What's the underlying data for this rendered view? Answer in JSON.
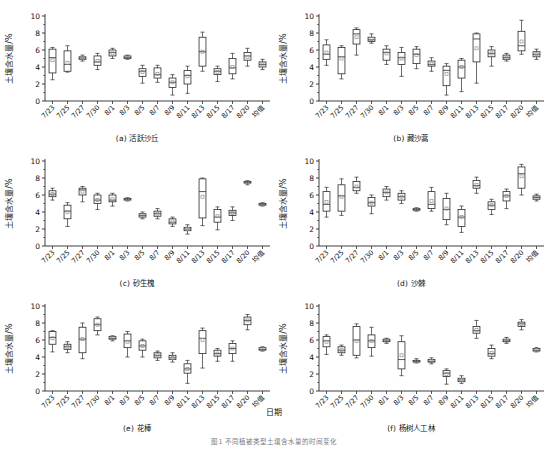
{
  "figure": {
    "xaxis_title": "日期",
    "caption": "图1  不同植被类型土壤含水量的时间变化",
    "ylabel": "土壤含水量/%",
    "yticks": [
      0,
      2,
      4,
      6,
      8,
      10
    ],
    "ylim": [
      0,
      10
    ],
    "categories": [
      "7/23",
      "7/25",
      "7/27",
      "7/30",
      "8/1",
      "8/3",
      "8/5",
      "8/7",
      "8/9",
      "8/11",
      "8/13",
      "8/15",
      "8/17",
      "8/20",
      "均值"
    ],
    "colors": {
      "line": "#2b2b2b",
      "box_fill": "#ffffff",
      "mean_marker": "#909090",
      "background": "#ffffff"
    }
  },
  "chart_data": [
    {
      "type": "box",
      "panel": "a",
      "title": "(a) 活跃沙丘",
      "xlabel": "日期",
      "ylabel": "土壤含水量/%",
      "ylim": [
        0,
        10
      ],
      "yticks": [
        0,
        2,
        4,
        6,
        8,
        10
      ],
      "grid": false,
      "categories": [
        "7/23",
        "7/25",
        "7/27",
        "7/30",
        "8/1",
        "8/3",
        "8/5",
        "8/7",
        "8/9",
        "8/11",
        "8/13",
        "8/15",
        "8/17",
        "8/20",
        "均值"
      ],
      "boxes": [
        {
          "x": "7/23",
          "min": 2.5,
          "q1": 3.3,
          "median": 5.1,
          "q3": 6.1,
          "max": 6.3,
          "mean": 4.8
        },
        {
          "x": "7/25",
          "min": 3.4,
          "q1": 3.5,
          "median": 4.3,
          "q3": 5.9,
          "max": 6.5,
          "mean": 4.5
        },
        {
          "x": "7/27",
          "min": 4.7,
          "q1": 4.9,
          "median": 5.05,
          "q3": 5.2,
          "max": 5.4,
          "mean": 5.05
        },
        {
          "x": "7/30",
          "min": 3.7,
          "q1": 4.2,
          "median": 4.6,
          "q3": 5.3,
          "max": 5.6,
          "mean": 4.7
        },
        {
          "x": "8/1",
          "min": 5.0,
          "q1": 5.3,
          "median": 5.7,
          "q3": 6.0,
          "max": 6.2,
          "mean": 5.6
        },
        {
          "x": "8/3",
          "min": 4.9,
          "q1": 5.0,
          "median": 5.1,
          "q3": 5.3,
          "max": 5.4,
          "mean": 5.1
        },
        {
          "x": "8/5",
          "min": 2.1,
          "q1": 2.9,
          "median": 3.5,
          "q3": 3.8,
          "max": 4.2,
          "mean": 3.4
        },
        {
          "x": "8/7",
          "min": 2.2,
          "q1": 2.7,
          "median": 3.1,
          "q3": 3.9,
          "max": 4.2,
          "mean": 3.2
        },
        {
          "x": "8/9",
          "min": 0.7,
          "q1": 1.6,
          "median": 2.2,
          "q3": 2.7,
          "max": 3.1,
          "mean": 2.2
        },
        {
          "x": "8/11",
          "min": 0.9,
          "q1": 2.0,
          "median": 3.0,
          "q3": 3.6,
          "max": 4.1,
          "mean": 2.9
        },
        {
          "x": "8/13",
          "min": 3.5,
          "q1": 4.1,
          "median": 5.8,
          "q3": 7.5,
          "max": 8.1,
          "mean": 5.8
        },
        {
          "x": "8/15",
          "min": 2.3,
          "q1": 3.1,
          "median": 3.5,
          "q3": 3.8,
          "max": 4.1,
          "mean": 3.4
        },
        {
          "x": "8/17",
          "min": 2.6,
          "q1": 3.2,
          "median": 3.9,
          "q3": 5.0,
          "max": 5.6,
          "mean": 4.0
        },
        {
          "x": "8/20",
          "min": 4.1,
          "q1": 4.8,
          "median": 5.3,
          "q3": 5.7,
          "max": 6.2,
          "mean": 5.2
        },
        {
          "x": "均值",
          "min": 3.7,
          "q1": 4.0,
          "median": 4.3,
          "q3": 4.6,
          "max": 4.9,
          "mean": 4.3
        }
      ]
    },
    {
      "type": "box",
      "panel": "b",
      "title": "(b) 藏沙蒿",
      "xlabel": "日期",
      "ylabel": "土壤含水量/%",
      "ylim": [
        0,
        10
      ],
      "yticks": [
        0,
        2,
        4,
        6,
        8,
        10
      ],
      "grid": false,
      "categories": [
        "7/23",
        "7/25",
        "7/27",
        "7/30",
        "8/1",
        "8/3",
        "8/5",
        "8/7",
        "8/9",
        "8/11",
        "8/13",
        "8/15",
        "8/17",
        "8/20",
        "均值"
      ],
      "boxes": [
        {
          "x": "7/23",
          "min": 4.2,
          "q1": 4.9,
          "median": 5.5,
          "q3": 6.6,
          "max": 7.2,
          "mean": 5.7
        },
        {
          "x": "7/25",
          "min": 2.6,
          "q1": 3.2,
          "median": 5.2,
          "q3": 6.3,
          "max": 6.5,
          "mean": 5.0
        },
        {
          "x": "7/27",
          "min": 5.4,
          "q1": 6.7,
          "median": 7.9,
          "q3": 8.4,
          "max": 8.6,
          "mean": 7.5
        },
        {
          "x": "7/30",
          "min": 6.8,
          "q1": 7.0,
          "median": 7.2,
          "q3": 7.5,
          "max": 7.9,
          "mean": 7.3
        },
        {
          "x": "8/1",
          "min": 4.3,
          "q1": 4.8,
          "median": 5.7,
          "q3": 6.1,
          "max": 6.5,
          "mean": 5.6
        },
        {
          "x": "8/3",
          "min": 2.9,
          "q1": 4.3,
          "median": 5.1,
          "q3": 5.7,
          "max": 6.3,
          "mean": 5.0
        },
        {
          "x": "8/5",
          "min": 3.8,
          "q1": 4.4,
          "median": 5.5,
          "q3": 6.1,
          "max": 6.4,
          "mean": 5.4
        },
        {
          "x": "8/7",
          "min": 3.5,
          "q1": 4.1,
          "median": 4.3,
          "q3": 4.7,
          "max": 5.1,
          "mean": 4.4
        },
        {
          "x": "8/9",
          "min": 0.7,
          "q1": 1.8,
          "median": 3.6,
          "q3": 4.1,
          "max": 4.4,
          "mean": 3.2
        },
        {
          "x": "8/11",
          "min": 1.1,
          "q1": 2.7,
          "median": 4.0,
          "q3": 4.8,
          "max": 5.0,
          "mean": 4.0
        },
        {
          "x": "8/13",
          "min": 2.1,
          "q1": 4.6,
          "median": 7.3,
          "q3": 7.9,
          "max": 8.0,
          "mean": 6.2
        },
        {
          "x": "8/15",
          "min": 4.1,
          "q1": 5.2,
          "median": 5.6,
          "q3": 6.0,
          "max": 6.4,
          "mean": 5.6
        },
        {
          "x": "8/17",
          "min": 4.7,
          "q1": 4.9,
          "median": 5.1,
          "q3": 5.4,
          "max": 5.6,
          "mean": 5.1
        },
        {
          "x": "8/20",
          "min": 5.5,
          "q1": 5.9,
          "median": 6.5,
          "q3": 8.2,
          "max": 9.5,
          "mean": 7.0
        },
        {
          "x": "均值",
          "min": 4.9,
          "q1": 5.2,
          "median": 5.5,
          "q3": 5.8,
          "max": 6.1,
          "mean": 5.5
        }
      ]
    },
    {
      "type": "box",
      "panel": "c",
      "title": "(c) 砂生槐",
      "xlabel": "日期",
      "ylabel": "土壤含水量/%",
      "ylim": [
        0,
        10
      ],
      "yticks": [
        0,
        2,
        4,
        6,
        8,
        10
      ],
      "grid": false,
      "categories": [
        "7/23",
        "7/25",
        "7/27",
        "7/30",
        "8/1",
        "8/3",
        "8/5",
        "8/7",
        "8/9",
        "8/11",
        "8/13",
        "8/15",
        "8/17",
        "8/20",
        "均值"
      ],
      "boxes": [
        {
          "x": "7/23",
          "min": 5.4,
          "q1": 5.8,
          "median": 6.1,
          "q3": 6.5,
          "max": 6.8,
          "mean": 6.1
        },
        {
          "x": "7/25",
          "min": 2.3,
          "q1": 3.2,
          "median": 4.1,
          "q3": 4.8,
          "max": 5.1,
          "mean": 4.0
        },
        {
          "x": "7/27",
          "min": 5.2,
          "q1": 6.0,
          "median": 6.6,
          "q3": 6.8,
          "max": 7.0,
          "mean": 6.4
        },
        {
          "x": "7/30",
          "min": 4.3,
          "q1": 5.0,
          "median": 5.4,
          "q3": 6.0,
          "max": 6.2,
          "mean": 5.4
        },
        {
          "x": "8/1",
          "min": 4.7,
          "q1": 5.2,
          "median": 5.4,
          "q3": 6.0,
          "max": 6.2,
          "mean": 5.5
        },
        {
          "x": "8/3",
          "min": 5.3,
          "q1": 5.4,
          "median": 5.5,
          "q3": 5.6,
          "max": 5.7,
          "mean": 5.5
        },
        {
          "x": "8/5",
          "min": 3.2,
          "q1": 3.4,
          "median": 3.6,
          "q3": 3.8,
          "max": 4.0,
          "mean": 3.6
        },
        {
          "x": "8/7",
          "min": 3.2,
          "q1": 3.5,
          "median": 3.8,
          "q3": 4.1,
          "max": 4.4,
          "mean": 3.8
        },
        {
          "x": "8/9",
          "min": 2.3,
          "q1": 2.6,
          "median": 2.8,
          "q3": 3.2,
          "max": 3.4,
          "mean": 2.9
        },
        {
          "x": "8/11",
          "min": 1.4,
          "q1": 1.8,
          "median": 2.0,
          "q3": 2.2,
          "max": 2.5,
          "mean": 2.0
        },
        {
          "x": "8/13",
          "min": 2.4,
          "q1": 3.3,
          "median": 6.4,
          "q3": 7.9,
          "max": 8.0,
          "mean": 5.8
        },
        {
          "x": "8/15",
          "min": 1.9,
          "q1": 2.8,
          "median": 3.4,
          "q3": 4.3,
          "max": 4.6,
          "mean": 3.5
        },
        {
          "x": "8/17",
          "min": 3.0,
          "q1": 3.6,
          "median": 3.9,
          "q3": 4.2,
          "max": 4.6,
          "mean": 3.9
        },
        {
          "x": "8/20",
          "min": 7.2,
          "q1": 7.4,
          "median": 7.5,
          "q3": 7.6,
          "max": 7.7,
          "mean": 7.5
        },
        {
          "x": "均值",
          "min": 4.7,
          "q1": 4.8,
          "median": 4.9,
          "q3": 5.0,
          "max": 5.1,
          "mean": 4.9
        }
      ]
    },
    {
      "type": "box",
      "panel": "d",
      "title": "(d) 沙棘",
      "xlabel": "日期",
      "ylabel": "土壤含水量/%",
      "ylim": [
        0,
        10
      ],
      "yticks": [
        0,
        2,
        4,
        6,
        8,
        10
      ],
      "grid": false,
      "categories": [
        "7/23",
        "7/25",
        "7/27",
        "7/30",
        "8/1",
        "8/3",
        "8/5",
        "8/7",
        "8/9",
        "8/11",
        "8/13",
        "8/15",
        "8/17",
        "8/20",
        "均值"
      ],
      "boxes": [
        {
          "x": "7/23",
          "min": 3.4,
          "q1": 4.1,
          "median": 4.9,
          "q3": 6.4,
          "max": 6.9,
          "mean": 5.2
        },
        {
          "x": "7/25",
          "min": 3.6,
          "q1": 4.1,
          "median": 5.9,
          "q3": 7.2,
          "max": 7.9,
          "mean": 5.8
        },
        {
          "x": "7/27",
          "min": 6.2,
          "q1": 6.5,
          "median": 6.9,
          "q3": 7.6,
          "max": 8.1,
          "mean": 7.0
        },
        {
          "x": "7/30",
          "min": 3.8,
          "q1": 4.7,
          "median": 5.1,
          "q3": 5.7,
          "max": 6.0,
          "mean": 5.1
        },
        {
          "x": "8/1",
          "min": 5.4,
          "q1": 5.8,
          "median": 6.3,
          "q3": 6.7,
          "max": 7.0,
          "mean": 6.3
        },
        {
          "x": "8/3",
          "min": 5.0,
          "q1": 5.4,
          "median": 5.8,
          "q3": 6.2,
          "max": 6.5,
          "mean": 5.8
        },
        {
          "x": "8/5",
          "min": 4.1,
          "q1": 4.2,
          "median": 4.3,
          "q3": 4.4,
          "max": 4.5,
          "mean": 4.3
        },
        {
          "x": "8/7",
          "min": 4.1,
          "q1": 4.4,
          "median": 4.9,
          "q3": 6.4,
          "max": 6.9,
          "mean": 5.3
        },
        {
          "x": "8/9",
          "min": 2.5,
          "q1": 3.1,
          "median": 4.3,
          "q3": 5.6,
          "max": 6.2,
          "mean": 4.4
        },
        {
          "x": "8/11",
          "min": 1.6,
          "q1": 2.3,
          "median": 3.4,
          "q3": 4.3,
          "max": 4.7,
          "mean": 3.4
        },
        {
          "x": "8/13",
          "min": 6.2,
          "q1": 6.8,
          "median": 7.1,
          "q3": 7.7,
          "max": 8.1,
          "mean": 7.2
        },
        {
          "x": "8/15",
          "min": 3.7,
          "q1": 4.3,
          "median": 4.8,
          "q3": 5.2,
          "max": 5.5,
          "mean": 4.8
        },
        {
          "x": "8/17",
          "min": 4.4,
          "q1": 5.3,
          "median": 5.9,
          "q3": 6.4,
          "max": 6.7,
          "mean": 5.9
        },
        {
          "x": "8/20",
          "min": 6.0,
          "q1": 6.8,
          "median": 8.5,
          "q3": 9.3,
          "max": 9.6,
          "mean": 8.2
        },
        {
          "x": "均值",
          "min": 5.3,
          "q1": 5.5,
          "median": 5.7,
          "q3": 5.9,
          "max": 6.1,
          "mean": 5.7
        }
      ]
    },
    {
      "type": "box",
      "panel": "e",
      "title": "(e) 花棒",
      "xlabel": "日期",
      "ylabel": "土壤含水量/%",
      "ylim": [
        0,
        10
      ],
      "yticks": [
        0,
        2,
        4,
        6,
        8,
        10
      ],
      "grid": false,
      "categories": [
        "7/23",
        "7/25",
        "7/27",
        "7/30",
        "8/1",
        "8/3",
        "8/5",
        "8/7",
        "8/9",
        "8/11",
        "8/13",
        "8/15",
        "8/17",
        "8/20",
        "均值"
      ],
      "boxes": [
        {
          "x": "7/23",
          "min": 4.6,
          "q1": 5.5,
          "median": 6.3,
          "q3": 7.0,
          "max": 7.1,
          "mean": 6.2
        },
        {
          "x": "7/25",
          "min": 4.5,
          "q1": 4.9,
          "median": 5.2,
          "q3": 5.5,
          "max": 5.8,
          "mean": 5.2
        },
        {
          "x": "7/27",
          "min": 3.8,
          "q1": 4.5,
          "median": 6.1,
          "q3": 7.5,
          "max": 8.0,
          "mean": 6.1
        },
        {
          "x": "7/30",
          "min": 6.6,
          "q1": 7.1,
          "median": 7.8,
          "q3": 8.5,
          "max": 8.7,
          "mean": 7.8
        },
        {
          "x": "8/1",
          "min": 5.9,
          "q1": 6.1,
          "median": 6.2,
          "q3": 6.4,
          "max": 6.5,
          "mean": 6.2
        },
        {
          "x": "8/3",
          "min": 4.0,
          "q1": 5.1,
          "median": 5.9,
          "q3": 6.7,
          "max": 7.0,
          "mean": 5.8
        },
        {
          "x": "8/5",
          "min": 4.0,
          "q1": 4.8,
          "median": 5.3,
          "q3": 5.9,
          "max": 6.1,
          "mean": 5.3
        },
        {
          "x": "8/7",
          "min": 3.6,
          "q1": 3.9,
          "median": 4.2,
          "q3": 4.5,
          "max": 4.7,
          "mean": 4.2
        },
        {
          "x": "8/9",
          "min": 3.4,
          "q1": 3.7,
          "median": 3.9,
          "q3": 4.2,
          "max": 4.5,
          "mean": 3.9
        },
        {
          "x": "8/11",
          "min": 0.9,
          "q1": 2.1,
          "median": 2.6,
          "q3": 3.2,
          "max": 3.6,
          "mean": 2.6
        },
        {
          "x": "8/13",
          "min": 2.7,
          "q1": 4.4,
          "median": 6.2,
          "q3": 7.1,
          "max": 7.4,
          "mean": 6.0
        },
        {
          "x": "8/15",
          "min": 3.5,
          "q1": 4.1,
          "median": 4.4,
          "q3": 4.8,
          "max": 5.0,
          "mean": 4.4
        },
        {
          "x": "8/17",
          "min": 3.5,
          "q1": 4.4,
          "median": 5.0,
          "q3": 5.6,
          "max": 5.9,
          "mean": 5.0
        },
        {
          "x": "8/20",
          "min": 7.2,
          "q1": 7.8,
          "median": 8.3,
          "q3": 8.7,
          "max": 9.0,
          "mean": 8.3
        },
        {
          "x": "均值",
          "min": 4.7,
          "q1": 4.8,
          "median": 4.9,
          "q3": 5.1,
          "max": 5.2,
          "mean": 4.9
        }
      ]
    },
    {
      "type": "box",
      "panel": "f",
      "title": "(f) 杨树人工林",
      "xlabel": "日期",
      "ylabel": "土壤含水量/%",
      "ylim": [
        0,
        10
      ],
      "yticks": [
        0,
        2,
        4,
        6,
        8,
        10
      ],
      "grid": false,
      "categories": [
        "7/23",
        "7/25",
        "7/27",
        "7/30",
        "8/1",
        "8/3",
        "8/5",
        "8/7",
        "8/9",
        "8/11",
        "8/13",
        "8/15",
        "8/17",
        "8/20",
        "均值"
      ],
      "boxes": [
        {
          "x": "7/23",
          "min": 4.3,
          "q1": 5.2,
          "median": 5.9,
          "q3": 6.4,
          "max": 6.6,
          "mean": 5.8
        },
        {
          "x": "7/25",
          "min": 4.2,
          "q1": 4.5,
          "median": 4.8,
          "q3": 5.2,
          "max": 5.4,
          "mean": 4.8
        },
        {
          "x": "7/27",
          "min": 3.9,
          "q1": 4.2,
          "median": 6.0,
          "q3": 7.6,
          "max": 7.9,
          "mean": 5.9
        },
        {
          "x": "7/30",
          "min": 4.1,
          "q1": 5.1,
          "median": 5.9,
          "q3": 6.6,
          "max": 7.5,
          "mean": 5.9
        },
        {
          "x": "8/1",
          "min": 5.6,
          "q1": 5.8,
          "median": 5.9,
          "q3": 6.1,
          "max": 6.2,
          "mean": 5.9
        },
        {
          "x": "8/3",
          "min": 1.8,
          "q1": 2.6,
          "median": 3.7,
          "q3": 5.8,
          "max": 6.5,
          "mean": 4.2
        },
        {
          "x": "8/5",
          "min": 3.3,
          "q1": 3.4,
          "median": 3.5,
          "q3": 3.6,
          "max": 3.8,
          "mean": 3.5
        },
        {
          "x": "8/7",
          "min": 3.2,
          "q1": 3.4,
          "median": 3.5,
          "q3": 3.7,
          "max": 3.9,
          "mean": 3.5
        },
        {
          "x": "8/9",
          "min": 0.8,
          "q1": 1.7,
          "median": 2.1,
          "q3": 2.4,
          "max": 2.6,
          "mean": 2.0
        },
        {
          "x": "8/11",
          "min": 0.9,
          "q1": 1.1,
          "median": 1.3,
          "q3": 1.5,
          "max": 1.8,
          "mean": 1.3
        },
        {
          "x": "8/13",
          "min": 6.2,
          "q1": 6.8,
          "median": 7.1,
          "q3": 7.6,
          "max": 8.3,
          "mean": 7.2
        },
        {
          "x": "8/15",
          "min": 3.8,
          "q1": 4.1,
          "median": 4.4,
          "q3": 5.0,
          "max": 5.4,
          "mean": 4.5
        },
        {
          "x": "8/17",
          "min": 5.6,
          "q1": 5.8,
          "median": 5.9,
          "q3": 6.1,
          "max": 6.3,
          "mean": 5.9
        },
        {
          "x": "8/20",
          "min": 7.2,
          "q1": 7.6,
          "median": 7.9,
          "q3": 8.1,
          "max": 8.4,
          "mean": 7.9
        },
        {
          "x": "均值",
          "min": 4.6,
          "q1": 4.7,
          "median": 4.8,
          "q3": 5.0,
          "max": 5.1,
          "mean": 4.8
        }
      ]
    }
  ]
}
